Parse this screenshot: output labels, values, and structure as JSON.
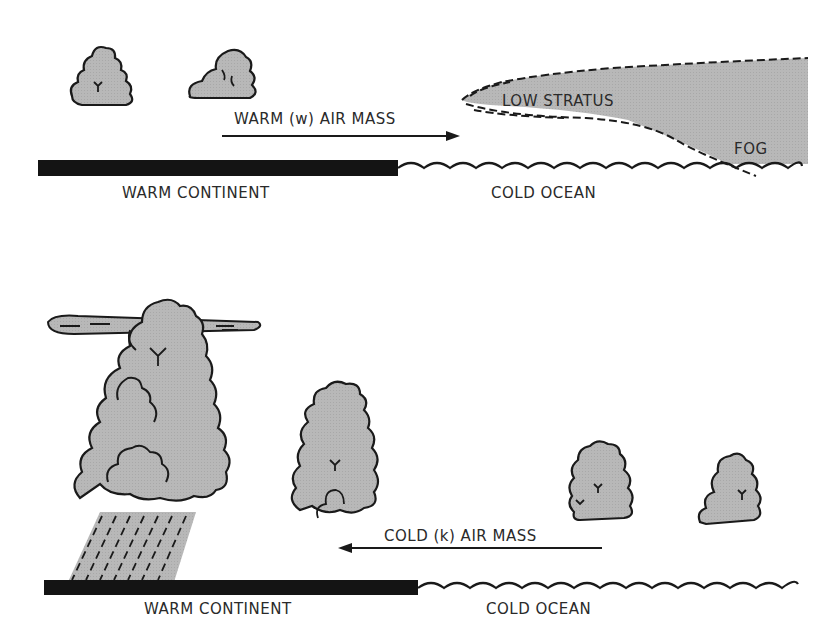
{
  "colors": {
    "cloud_fill": "#b4b4b4",
    "outline": "#1a1a1a",
    "land": "#141414",
    "background": "#ffffff"
  },
  "panels": [
    {
      "id": "top",
      "arrow_label": "WARM (w) AIR MASS",
      "arrow_direction": "right",
      "land_label": "WARM CONTINENT",
      "ocean_label": "COLD OCEAN",
      "stratus_label": "LOW STRATUS",
      "fog_label": "FOG",
      "clouds": [
        "small-cumulus",
        "small-cumulus"
      ]
    },
    {
      "id": "bottom",
      "arrow_label": "COLD (k) AIR MASS",
      "arrow_direction": "left",
      "land_label": "WARM CONTINENT",
      "ocean_label": "COLD OCEAN",
      "clouds": [
        "cumulonimbus-with-anvil-and-rain",
        "towering-cumulus",
        "cumulus",
        "cumulus"
      ]
    }
  ]
}
